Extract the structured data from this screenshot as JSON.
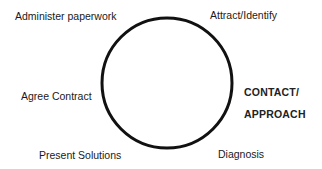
{
  "diagram": {
    "type": "cycle",
    "circle": {
      "cx": 167,
      "cy": 83,
      "r": 65,
      "stroke": "#111111",
      "stroke_width": 3
    },
    "stages": [
      {
        "id": "attract-identify",
        "label": "Attract/Identify"
      },
      {
        "id": "contact-approach",
        "label_line1": "CONTACT/",
        "label_line2": "APPROACH",
        "emphasized": true
      },
      {
        "id": "diagnosis",
        "label": "Diagnosis"
      },
      {
        "id": "present-solutions",
        "label": "Present Solutions"
      },
      {
        "id": "agree-contract",
        "label": "Agree Contract"
      },
      {
        "id": "administer-paperwork",
        "label": "Administer paperwork"
      }
    ]
  }
}
